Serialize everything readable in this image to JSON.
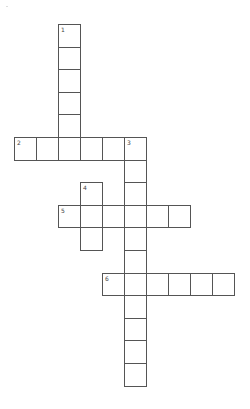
{
  "puzzle": {
    "type": "crossword",
    "grid_origin": {
      "x": 14,
      "y": 24
    },
    "cell_size": {
      "w": 22,
      "h": 22.6
    },
    "colors": {
      "border": "#555555",
      "cell_fill": "#ffffff",
      "number_text": "#444444"
    },
    "words": [
      {
        "number": "1",
        "direction": "down",
        "row": 0,
        "col": 2,
        "length": 6
      },
      {
        "number": "2",
        "direction": "across",
        "row": 5,
        "col": 0,
        "length": 6
      },
      {
        "number": "3",
        "direction": "down",
        "row": 5,
        "col": 5,
        "length": 11
      },
      {
        "number": "4",
        "direction": "down",
        "row": 7,
        "col": 3,
        "length": 3
      },
      {
        "number": "5",
        "direction": "across",
        "row": 8,
        "col": 2,
        "length": 6
      },
      {
        "number": "6",
        "direction": "across",
        "row": 11,
        "col": 4,
        "length": 6
      }
    ]
  }
}
